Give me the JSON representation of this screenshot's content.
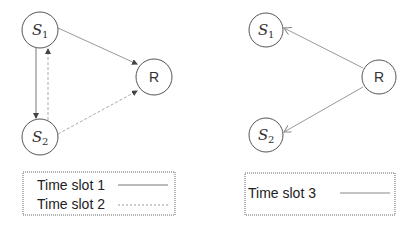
{
  "diagram": {
    "left_panel": {
      "nodes": [
        {
          "id": "S1",
          "label": "S",
          "subscript": "1",
          "cx": 40,
          "cy": 30,
          "r": 18
        },
        {
          "id": "S2",
          "label": "S",
          "subscript": "2",
          "cx": 40,
          "cy": 137,
          "r": 18
        },
        {
          "id": "R",
          "label": "R",
          "cx": 154,
          "cy": 77,
          "r": 18
        }
      ],
      "edges": [
        {
          "from": "S1",
          "to": "S2",
          "style": "solid",
          "time_slot": 1
        },
        {
          "from": "S1",
          "to": "R",
          "style": "solid",
          "time_slot": 1
        },
        {
          "from": "S2",
          "to": "S1",
          "style": "dashed",
          "time_slot": 2
        },
        {
          "from": "S2",
          "to": "R",
          "style": "dashed",
          "time_slot": 2
        }
      ],
      "legend": [
        {
          "label": "Time slot 1",
          "style": "solid"
        },
        {
          "label": "Time slot 2",
          "style": "dashed"
        }
      ]
    },
    "right_panel": {
      "nodes": [
        {
          "id": "S1",
          "label": "S",
          "subscript": "1",
          "cx": 266,
          "cy": 30,
          "r": 17
        },
        {
          "id": "S2",
          "label": "S",
          "subscript": "2",
          "cx": 266,
          "cy": 135,
          "r": 17
        },
        {
          "id": "R",
          "label": "R",
          "cx": 379,
          "cy": 77,
          "r": 17
        }
      ],
      "edges": [
        {
          "from": "R",
          "to": "S1",
          "style": "solid",
          "time_slot": 3
        },
        {
          "from": "R",
          "to": "S2",
          "style": "solid",
          "time_slot": 3
        }
      ],
      "legend": [
        {
          "label": "Time slot 3",
          "style": "solid"
        }
      ]
    },
    "colors": {
      "node_stroke": "#555555",
      "edge": "#888888",
      "legend_border": "#666666"
    }
  }
}
